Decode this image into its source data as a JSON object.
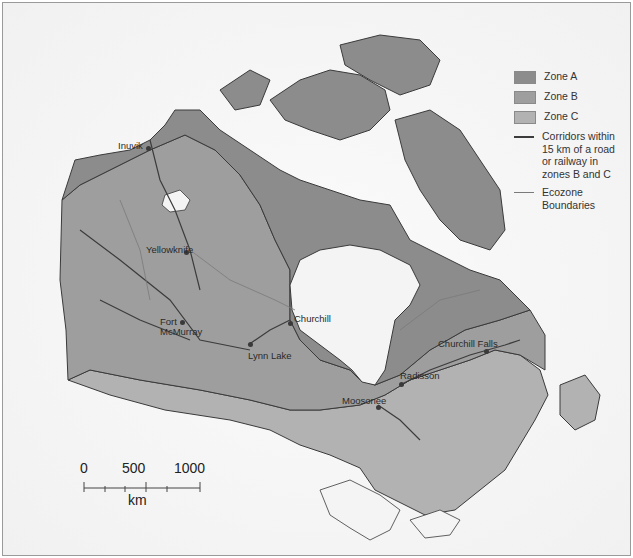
{
  "legend": {
    "items": [
      {
        "label": "Zone A",
        "type": "area",
        "color": "#8c8c8c"
      },
      {
        "label": "Zone B",
        "type": "area",
        "color": "#9e9e9e"
      },
      {
        "label": "Zone C",
        "type": "area",
        "color": "#b2b2b2"
      },
      {
        "label": "Corridors within 15 km of a road or railway in zones B and C",
        "type": "line",
        "color": "#3c3c3c"
      },
      {
        "label": "Ecozone Boundaries",
        "type": "line",
        "color": "#7a7a7a"
      }
    ]
  },
  "places": [
    {
      "name": "Inuvik"
    },
    {
      "name": "Yellowknife"
    },
    {
      "name": "Fort McMurray",
      "line1": "Fort",
      "line2": "McMurray"
    },
    {
      "name": "Lynn Lake"
    },
    {
      "name": "Churchill"
    },
    {
      "name": "Churchill Falls"
    },
    {
      "name": "Radisson"
    },
    {
      "name": "Moosonee"
    }
  ],
  "scale_bar": {
    "ticks": [
      "0",
      "500",
      "1000"
    ],
    "unit": "km"
  },
  "colors": {
    "zone_a": "#8c8c8c",
    "zone_b": "#9e9e9e",
    "zone_c": "#b2b2b2",
    "water": "#f4f4f4",
    "outline": "#3a3a3a"
  }
}
